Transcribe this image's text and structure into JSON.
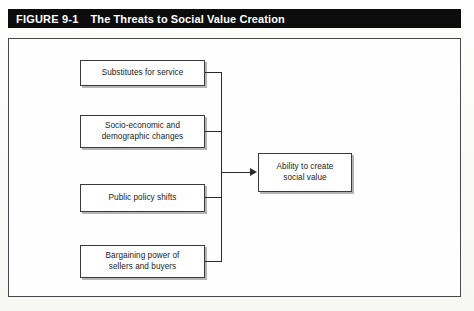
{
  "figure": {
    "number_label": "FIGURE 9-1",
    "title": "The Threats to Social Value Creation"
  },
  "diagram": {
    "type": "convergent-flow",
    "sources": [
      {
        "id": "substitutes",
        "label": "Substitutes for service"
      },
      {
        "id": "socio-demo",
        "label": "Socio-economic and\ndemographic changes"
      },
      {
        "id": "public-policy",
        "label": "Public policy shifts"
      },
      {
        "id": "bargaining",
        "label": "Bargaining power of\nsellers and buyers"
      }
    ],
    "target": {
      "id": "social-value",
      "label": "Ability to create\nsocial value"
    },
    "connector": {
      "style": "orthogonal-trunk-with-arrow",
      "arrow_direction": "right"
    }
  },
  "colors": {
    "title_bar_background": "#0c0c0c",
    "title_text": "#ffffff",
    "frame_border": "#4a4a4a",
    "box_border": "#3a3a3a",
    "box_fill": "#ffffff",
    "connector": "#2b2b2b",
    "page_background": "#fdfdfb"
  }
}
